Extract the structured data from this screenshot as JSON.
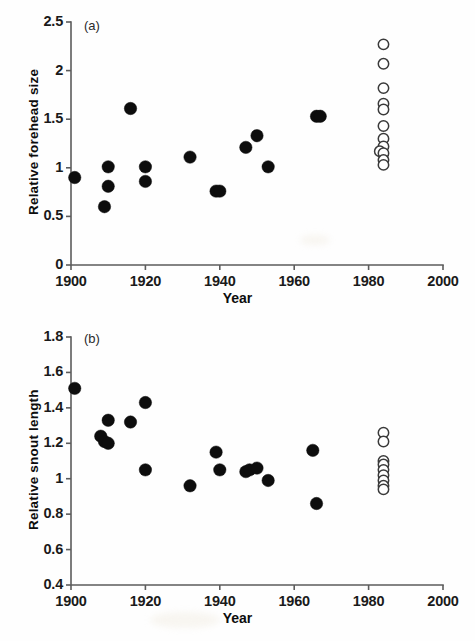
{
  "figure": {
    "background_color": "#fefefe",
    "filled_marker_color": "#0d0d0d",
    "open_marker_color": "#ffffff",
    "open_marker_edge_color": "#3a3a3a",
    "axis_color": "#5c5c5c"
  },
  "chart_data": [
    {
      "type": "scatter",
      "panel_label": "(a)",
      "title": "",
      "xlabel": "Year",
      "ylabel": "Relative forehead size",
      "xlim": [
        1900,
        2000
      ],
      "ylim": [
        0,
        2.5
      ],
      "xticks": [
        1900,
        1920,
        1940,
        1960,
        1980,
        2000
      ],
      "xticklabels": [
        "1900",
        "1920",
        "1940",
        "1960",
        "1980",
        "2000"
      ],
      "yticks": [
        0,
        0.5,
        1,
        1.5,
        2,
        2.5
      ],
      "yticklabels": [
        "0",
        "0.5",
        "1",
        "1.5",
        "2",
        "2.5"
      ],
      "grid": false,
      "legend": null,
      "series": [
        {
          "name": "historical-specimens",
          "marker": "filled-circle",
          "points": [
            {
              "x": 1901,
              "y": 0.9
            },
            {
              "x": 1909,
              "y": 0.6
            },
            {
              "x": 1910,
              "y": 1.01
            },
            {
              "x": 1910,
              "y": 0.81
            },
            {
              "x": 1916,
              "y": 1.61
            },
            {
              "x": 1920,
              "y": 1.01
            },
            {
              "x": 1920,
              "y": 0.86
            },
            {
              "x": 1932,
              "y": 1.11
            },
            {
              "x": 1939,
              "y": 0.76
            },
            {
              "x": 1940,
              "y": 0.76
            },
            {
              "x": 1947,
              "y": 1.21
            },
            {
              "x": 1950,
              "y": 1.33
            },
            {
              "x": 1953,
              "y": 1.01
            },
            {
              "x": 1966,
              "y": 1.53
            },
            {
              "x": 1967,
              "y": 1.53
            }
          ]
        },
        {
          "name": "modern-specimens",
          "marker": "open-circle",
          "points": [
            {
              "x": 1984,
              "y": 2.27
            },
            {
              "x": 1984,
              "y": 2.07
            },
            {
              "x": 1984,
              "y": 1.82
            },
            {
              "x": 1984,
              "y": 1.66
            },
            {
              "x": 1984,
              "y": 1.6
            },
            {
              "x": 1984,
              "y": 1.43
            },
            {
              "x": 1984,
              "y": 1.3
            },
            {
              "x": 1984,
              "y": 1.22
            },
            {
              "x": 1983,
              "y": 1.17
            },
            {
              "x": 1984,
              "y": 1.15
            },
            {
              "x": 1984,
              "y": 1.08
            },
            {
              "x": 1984,
              "y": 1.03
            }
          ]
        }
      ]
    },
    {
      "type": "scatter",
      "panel_label": "(b)",
      "title": "",
      "xlabel": "Year",
      "ylabel": "Relative snout length",
      "xlim": [
        1900,
        2000
      ],
      "ylim": [
        0.4,
        1.8
      ],
      "xticks": [
        1900,
        1920,
        1940,
        1960,
        1980,
        2000
      ],
      "xticklabels": [
        "1900",
        "1920",
        "1940",
        "1960",
        "1980",
        "2000"
      ],
      "yticks": [
        0.4,
        0.6,
        0.8,
        1.0,
        1.2,
        1.4,
        1.6,
        1.8
      ],
      "yticklabels": [
        "0.4",
        "0.6",
        "0.8",
        "1",
        "1.2",
        "1.4",
        "1.6",
        "1.8"
      ],
      "grid": false,
      "legend": null,
      "series": [
        {
          "name": "historical-specimens",
          "marker": "filled-circle",
          "points": [
            {
              "x": 1901,
              "y": 1.51
            },
            {
              "x": 1908,
              "y": 1.24
            },
            {
              "x": 1909,
              "y": 1.21
            },
            {
              "x": 1910,
              "y": 1.33
            },
            {
              "x": 1910,
              "y": 1.2
            },
            {
              "x": 1916,
              "y": 1.32
            },
            {
              "x": 1920,
              "y": 1.43
            },
            {
              "x": 1920,
              "y": 1.05
            },
            {
              "x": 1932,
              "y": 0.96
            },
            {
              "x": 1939,
              "y": 1.15
            },
            {
              "x": 1940,
              "y": 1.05
            },
            {
              "x": 1947,
              "y": 1.04
            },
            {
              "x": 1948,
              "y": 1.05
            },
            {
              "x": 1950,
              "y": 1.06
            },
            {
              "x": 1953,
              "y": 0.99
            },
            {
              "x": 1965,
              "y": 1.16
            },
            {
              "x": 1966,
              "y": 0.86
            }
          ]
        },
        {
          "name": "modern-specimens",
          "marker": "open-circle",
          "points": [
            {
              "x": 1984,
              "y": 1.26
            },
            {
              "x": 1984,
              "y": 1.21
            },
            {
              "x": 1984,
              "y": 1.1
            },
            {
              "x": 1984,
              "y": 1.08
            },
            {
              "x": 1984,
              "y": 1.05
            },
            {
              "x": 1984,
              "y": 1.02
            },
            {
              "x": 1984,
              "y": 0.99
            },
            {
              "x": 1984,
              "y": 0.96
            },
            {
              "x": 1984,
              "y": 0.94
            }
          ]
        }
      ]
    }
  ]
}
